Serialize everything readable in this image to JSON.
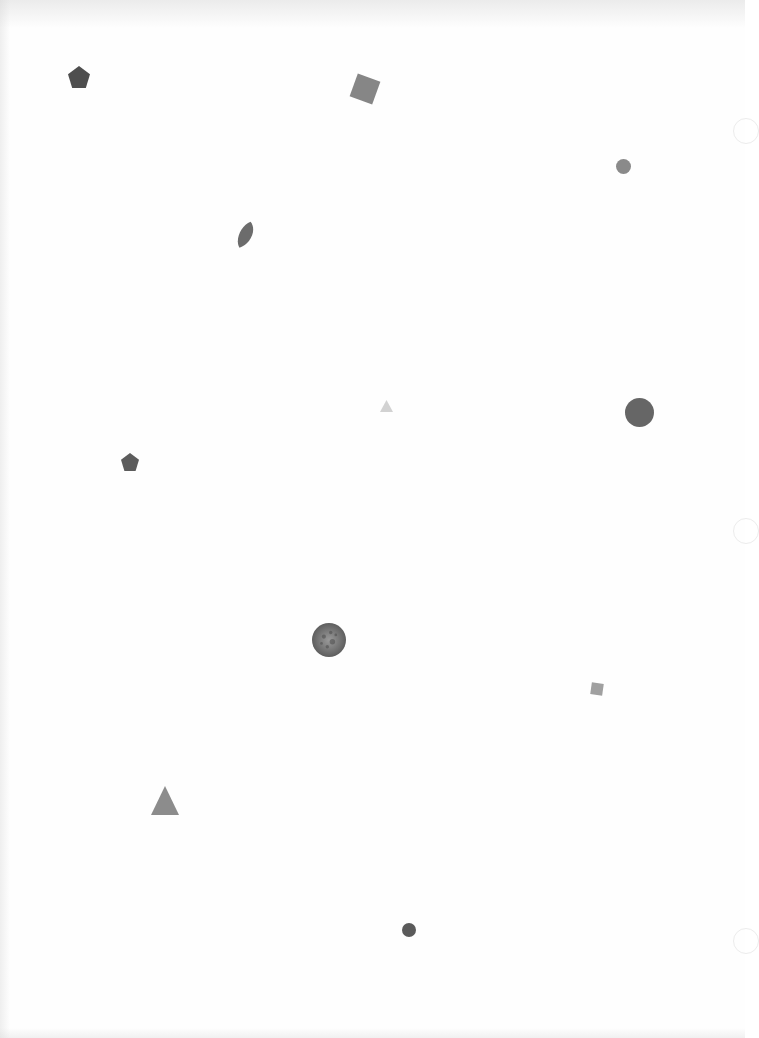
{
  "page": {
    "width": 745,
    "height": 1038,
    "background": "#fefefe"
  },
  "punch_holes": [
    {
      "y": 118
    },
    {
      "y": 518
    },
    {
      "y": 928
    }
  ],
  "shapes": [
    {
      "type": "pentagon",
      "x": 68,
      "y": 66,
      "w": 22,
      "h": 22,
      "rotate": 0,
      "color": "#4e4e4e"
    },
    {
      "type": "square",
      "x": 353,
      "y": 77,
      "w": 24,
      "h": 24,
      "rotate": 20,
      "color": "#868686"
    },
    {
      "type": "circle",
      "x": 616,
      "y": 159,
      "w": 15,
      "h": 15,
      "rotate": 0,
      "color": "#8a8a8a"
    },
    {
      "type": "leaf",
      "x": 236,
      "y": 221,
      "w": 20,
      "h": 28,
      "rotate": 15,
      "color": "#6c6c6c"
    },
    {
      "type": "triangle",
      "x": 380,
      "y": 400,
      "w": 13,
      "h": 12,
      "rotate": 0,
      "color": "#d2d2d2"
    },
    {
      "type": "circle",
      "x": 625,
      "y": 398,
      "w": 29,
      "h": 29,
      "rotate": 0,
      "color": "#666666"
    },
    {
      "type": "pentagon",
      "x": 121,
      "y": 453,
      "w": 18,
      "h": 18,
      "rotate": 0,
      "color": "#5c5c5c"
    },
    {
      "type": "textured-circle",
      "x": 312,
      "y": 623,
      "w": 34,
      "h": 34,
      "rotate": 0,
      "color": "#7a7a7a"
    },
    {
      "type": "square",
      "x": 591,
      "y": 683,
      "w": 12,
      "h": 12,
      "rotate": 8,
      "color": "#a0a0a0"
    },
    {
      "type": "triangle",
      "x": 151,
      "y": 786,
      "w": 28,
      "h": 29,
      "rotate": 0,
      "color": "#8c8c8c"
    },
    {
      "type": "circle",
      "x": 402,
      "y": 923,
      "w": 14,
      "h": 14,
      "rotate": 0,
      "color": "#5a5a5a"
    }
  ]
}
